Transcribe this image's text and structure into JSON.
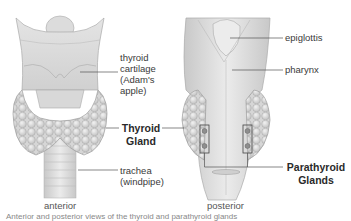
{
  "diagram": {
    "views": [
      {
        "id": "anterior",
        "label": "anterior"
      },
      {
        "id": "posterior",
        "label": "posterior"
      }
    ],
    "labels": {
      "thyroid_cartilage": "thyroid\ncartilage\n(Adam's\napple)",
      "thyroid_gland": "Thyroid\nGland",
      "trachea": "trachea\n(windpipe)",
      "epiglottis": "epiglottis",
      "pharynx": "pharynx",
      "parathyroid_glands": "Parathyroid\nGlands"
    },
    "caption": "Anterior and posterior views of the thyroid and parathyroid glands",
    "colors": {
      "tissue_light": "#e8e8e8",
      "tissue_mid": "#d4d4d4",
      "tissue_dark": "#b8b8b8",
      "leader_line": "#555555"
    }
  }
}
